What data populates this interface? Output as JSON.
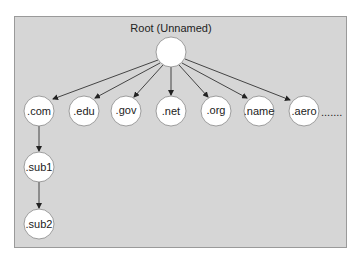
{
  "diagram": {
    "title": "Root (Unnamed)",
    "root": {
      "label": "",
      "cx": 171,
      "cy": 52
    },
    "tlds": [
      {
        "label": ".com",
        "cx": 39
      },
      {
        "label": ".edu",
        "cx": 84
      },
      {
        "label": ".gov",
        "cx": 126
      },
      {
        "label": ".net",
        "cx": 171
      },
      {
        "label": ".org",
        "cx": 216
      },
      {
        "label": ".name",
        "cx": 259
      },
      {
        "label": ".aero",
        "cx": 304
      }
    ],
    "tld_row_y": 111,
    "ellipsis": ".......",
    "subdomains": [
      {
        "label": ".sub1",
        "cx": 39,
        "cy": 167
      },
      {
        "label": ".sub2",
        "cx": 39,
        "cy": 224
      }
    ],
    "colors": {
      "panel": "#d6d6d6",
      "node_fill": "#ffffff",
      "edge": "#333333"
    }
  }
}
